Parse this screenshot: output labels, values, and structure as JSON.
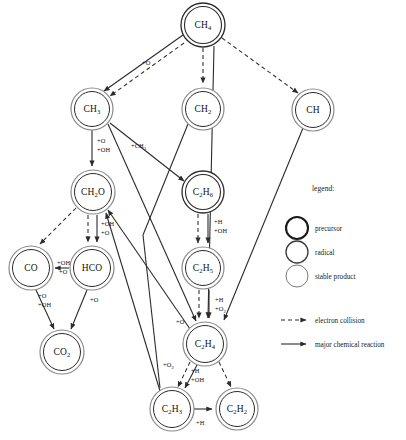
{
  "diagram": {
    "background": "#ffffff",
    "stroke_color": "#2b2b2b",
    "text_color": "#111111",
    "nodes": [
      {
        "id": "CH4",
        "label": "CH",
        "sub": "4",
        "x": 203,
        "y": 25,
        "r": 22,
        "style": "precursor"
      },
      {
        "id": "CH3",
        "label": "CH",
        "sub": "3",
        "x": 92,
        "y": 109,
        "r": 21,
        "style": "precursor"
      },
      {
        "id": "CH2",
        "label": "CH",
        "sub": "2",
        "x": 203,
        "y": 109,
        "r": 21,
        "style": "precursor"
      },
      {
        "id": "CH",
        "label": "CH",
        "sub": "",
        "x": 313,
        "y": 110,
        "r": 21,
        "style": "precursor"
      },
      {
        "id": "CH2O",
        "label": "CH",
        "sub": "2",
        "suffix": "O",
        "x": 93,
        "y": 192,
        "r": 22,
        "style": "precursor"
      },
      {
        "id": "C2H6",
        "label": "C",
        "sub": "2",
        "suffix2": "H",
        "sub2": "6",
        "x": 203,
        "y": 192,
        "r": 21,
        "style": "precursor"
      },
      {
        "id": "CO",
        "label": "CO",
        "sub": "",
        "x": 31,
        "y": 268,
        "r": 22,
        "style": "precursor"
      },
      {
        "id": "HCO",
        "label": "HCO",
        "sub": "",
        "x": 92,
        "y": 268,
        "r": 22,
        "style": "precursor"
      },
      {
        "id": "C2H5",
        "label": "C",
        "sub": "2",
        "suffix2": "H",
        "sub2": "5",
        "x": 203,
        "y": 268,
        "r": 21,
        "style": "precursor"
      },
      {
        "id": "CO2",
        "label": "CO",
        "sub": "2",
        "x": 62,
        "y": 352,
        "r": 22,
        "style": "precursor"
      },
      {
        "id": "C2H4",
        "label": "C",
        "sub": "2",
        "suffix2": "H",
        "sub2": "4",
        "x": 205,
        "y": 344,
        "r": 22,
        "style": "precursor"
      },
      {
        "id": "C2H3",
        "label": "C",
        "sub": "2",
        "suffix2": "H",
        "sub2": "3",
        "x": 172,
        "y": 409,
        "r": 22,
        "style": "precursor"
      },
      {
        "id": "C2H2",
        "label": "C",
        "sub": "2",
        "suffix2": "H",
        "sub2": "2",
        "x": 237,
        "y": 409,
        "r": 21,
        "style": "precursor"
      }
    ],
    "edges": [
      {
        "from": "CH4",
        "to": "CH3",
        "kind": "reaction",
        "label": "+O",
        "lx": 142,
        "ly": 63
      },
      {
        "from": "CH4",
        "to": "CH3",
        "kind": "collision",
        "label": "",
        "lx": 0,
        "ly": 0
      },
      {
        "from": "CH4",
        "to": "CH2",
        "kind": "collision",
        "label": "",
        "lx": 0,
        "ly": 0
      },
      {
        "from": "CH4",
        "to": "CH",
        "kind": "collision",
        "label": "",
        "lx": 0,
        "ly": 0
      },
      {
        "from": "CH4",
        "to": "C2H4",
        "kind": "reaction",
        "label": "",
        "lx": 0,
        "ly": 0
      },
      {
        "from": "CH3",
        "to": "CH2O",
        "kind": "reaction",
        "label": "+O",
        "lx": 97,
        "ly": 141
      },
      {
        "from": "CH3",
        "to": "CH2O2",
        "kind": "label-only",
        "label": "+OH",
        "lx": 97,
        "ly": 150
      },
      {
        "from": "CH3",
        "to": "C2H6",
        "kind": "reaction",
        "label": "+CH",
        "sub": "3",
        "lx": 133,
        "ly": 146
      },
      {
        "from": "CH3",
        "to": "C2H4",
        "kind": "reaction",
        "label": "",
        "lx": 0,
        "ly": 0
      },
      {
        "from": "CH2",
        "to": "C2H4",
        "kind": "reaction",
        "label": "",
        "lx": 0,
        "ly": 0
      },
      {
        "from": "CH",
        "to": "C2H4",
        "kind": "reaction",
        "label": "",
        "lx": 0,
        "ly": 0
      },
      {
        "from": "CH2O",
        "to": "CO",
        "kind": "collision",
        "label": "",
        "lx": 0,
        "ly": 0
      },
      {
        "from": "CH2O",
        "to": "HCO",
        "kind": "collision",
        "label": "",
        "lx": 0,
        "ly": 0
      },
      {
        "from": "CH2O",
        "to": "HCO",
        "kind": "reaction",
        "label": "+OH",
        "lx": 100,
        "ly": 224
      },
      {
        "from": "CH2O",
        "to": "HCO2",
        "kind": "label-only",
        "label": "+O",
        "lx": 100,
        "ly": 233
      },
      {
        "from": "HCO",
        "to": "CO",
        "kind": "reaction",
        "label": "+OH",
        "lx": 57,
        "ly": 263
      },
      {
        "from": "HCO",
        "to": "CO2b",
        "kind": "label-only",
        "label": "+O",
        "lx": 57,
        "ly": 272
      },
      {
        "from": "CO",
        "to": "CO2",
        "kind": "reaction",
        "label": "+O",
        "lx": 38,
        "ly": 296
      },
      {
        "from": "CO",
        "to": "CO2c",
        "kind": "label-only",
        "label": "+OH",
        "lx": 38,
        "ly": 305
      },
      {
        "from": "HCO",
        "to": "CO2",
        "kind": "reaction",
        "label": "+O",
        "lx": 90,
        "ly": 300
      },
      {
        "from": "C2H6",
        "to": "C2H5",
        "kind": "collision",
        "label": "",
        "lx": 0,
        "ly": 0
      },
      {
        "from": "C2H6",
        "to": "C2H5",
        "kind": "reaction",
        "label": "+H",
        "lx": 212,
        "ly": 222
      },
      {
        "from": "C2H6",
        "to": "C2H5b",
        "kind": "label-only",
        "label": "+OH",
        "lx": 212,
        "ly": 231
      },
      {
        "from": "C2H5",
        "to": "C2H4",
        "kind": "collision",
        "label": "",
        "lx": 0,
        "ly": 0
      },
      {
        "from": "C2H5",
        "to": "C2H4",
        "kind": "reaction",
        "label": "+H",
        "lx": 213,
        "ly": 300
      },
      {
        "from": "C2H5",
        "to": "C2H4b",
        "kind": "label-only",
        "label": "+O",
        "sub": "2",
        "lx": 213,
        "ly": 309
      },
      {
        "from": "C2H4",
        "to": "CH2O",
        "kind": "reaction",
        "label": "+O",
        "lx": 178,
        "ly": 322
      },
      {
        "from": "C2H3",
        "to": "CH2O",
        "kind": "reaction",
        "label": "+O",
        "sub": "2",
        "lx": 167,
        "ly": 365
      },
      {
        "from": "C2H4",
        "to": "C2H3",
        "kind": "collision",
        "label": "",
        "lx": 0,
        "ly": 0
      },
      {
        "from": "C2H4",
        "to": "C2H3",
        "kind": "reaction",
        "label": "+H",
        "lx": 190,
        "ly": 371
      },
      {
        "from": "C2H4",
        "to": "C2H3b",
        "kind": "label-only",
        "label": "+OH",
        "lx": 190,
        "ly": 380
      },
      {
        "from": "C2H4",
        "to": "C2H2",
        "kind": "collision",
        "label": "",
        "lx": 0,
        "ly": 0
      },
      {
        "from": "C2H3",
        "to": "C2H2",
        "kind": "reaction",
        "label": "+H",
        "lx": 197,
        "ly": 423
      }
    ]
  },
  "legend": {
    "title": "legend:",
    "shapes": [
      {
        "key": "precursor",
        "label": "precursor",
        "cx": 297,
        "cy": 228,
        "r": 11,
        "stroke_width": 2.1
      },
      {
        "key": "radical",
        "label": "radical",
        "cx": 297,
        "cy": 252,
        "r": 11,
        "stroke_width": 1.3
      },
      {
        "key": "stable-product",
        "label": "stable product",
        "cx": 297,
        "cy": 276,
        "r": 11,
        "stroke_width": 0.9
      }
    ],
    "arrows": [
      {
        "key": "electron-collision",
        "label": "electron collision",
        "x": 281,
        "y": 320,
        "style": "dashed"
      },
      {
        "key": "major-chemical-reaction",
        "label": "major chemical reaction",
        "x": 281,
        "y": 344,
        "style": "solid"
      }
    ],
    "title_x": 312,
    "title_y": 188
  }
}
